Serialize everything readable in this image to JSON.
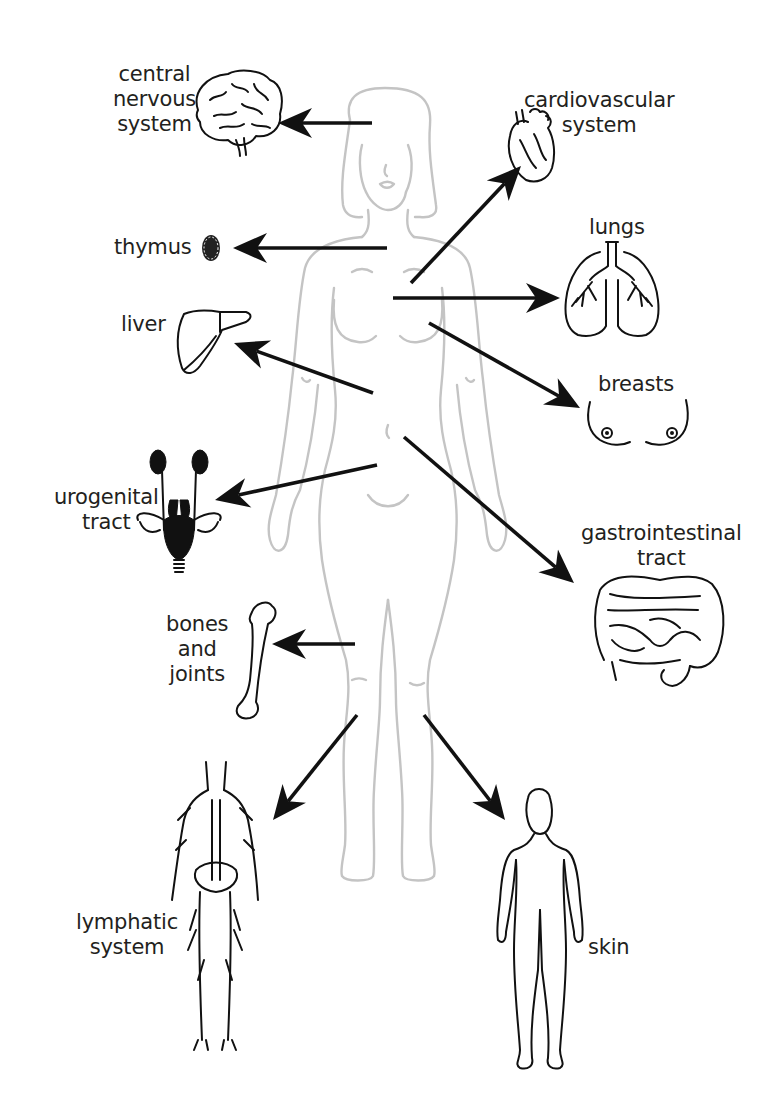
{
  "diagram": {
    "type": "anatomical-organ-map",
    "center_figure": "female-body-outline",
    "colors": {
      "body_outline": "#c4c4c4",
      "arrows": "#111111",
      "text": "#231f20",
      "background": "#ffffff"
    },
    "organs": [
      {
        "id": "cns",
        "label": "central\nnervous\nsystem",
        "icon": "brain-icon",
        "side": "left",
        "label_pos": [
          113,
          62
        ],
        "arrow": {
          "from": [
            372,
            123
          ],
          "to": [
            278,
            123
          ]
        }
      },
      {
        "id": "cardio",
        "label": "cardiovascular\nsystem",
        "icon": "heart-icon",
        "side": "right",
        "label_pos": [
          534,
          88
        ],
        "arrow": {
          "from": [
            411,
            283
          ],
          "to": [
            521,
            166
          ]
        }
      },
      {
        "id": "thymus",
        "label": "thymus",
        "icon": "thymus-icon",
        "side": "left",
        "label_pos": [
          114,
          235
        ],
        "arrow": {
          "from": [
            387,
            248
          ],
          "to": [
            233,
            248
          ]
        }
      },
      {
        "id": "lungs",
        "label": "lungs",
        "icon": "lungs-icon",
        "side": "right",
        "label_pos": [
          589,
          215
        ],
        "arrow": {
          "from": [
            393,
            298
          ],
          "to": [
            560,
            298
          ]
        }
      },
      {
        "id": "liver",
        "label": "liver",
        "icon": "liver-icon",
        "side": "left",
        "label_pos": [
          121,
          312
        ],
        "arrow": {
          "from": [
            373,
            393
          ],
          "to": [
            234,
            343
          ]
        }
      },
      {
        "id": "breasts",
        "label": "breasts",
        "icon": "breasts-icon",
        "side": "right",
        "label_pos": [
          596,
          372
        ],
        "arrow": {
          "from": [
            429,
            323
          ],
          "to": [
            580,
            408
          ]
        }
      },
      {
        "id": "urogenital",
        "label": "urogenital\ntract",
        "icon": "urogenital-icon",
        "side": "left",
        "label_pos": [
          56,
          485
        ],
        "arrow": {
          "from": [
            377,
            465
          ],
          "to": [
            215,
            500
          ]
        }
      },
      {
        "id": "gi",
        "label": "gastrointestinal\ntract",
        "icon": "intestines-icon",
        "side": "right",
        "label_pos": [
          581,
          521
        ],
        "arrow": {
          "from": [
            404,
            437
          ],
          "to": [
            574,
            583
          ]
        }
      },
      {
        "id": "bones",
        "label": "bones\nand\njoints",
        "icon": "bone-icon",
        "side": "left",
        "label_pos": [
          164,
          617
        ],
        "arrow": {
          "from": [
            355,
            644
          ],
          "to": [
            272,
            644
          ]
        }
      },
      {
        "id": "lymphatic",
        "label": "lymphatic\nsystem",
        "icon": "lymphatic-icon",
        "side": "left",
        "label_pos": [
          78,
          908
        ],
        "arrow": {
          "from": [
            357,
            715
          ],
          "to": [
            273,
            820
          ]
        }
      },
      {
        "id": "skin",
        "label": "skin",
        "icon": "skin-silhouette-icon",
        "side": "right",
        "label_pos": [
          580,
          935
        ],
        "arrow": {
          "from": [
            424,
            715
          ],
          "to": [
            505,
            820
          ]
        }
      }
    ]
  }
}
